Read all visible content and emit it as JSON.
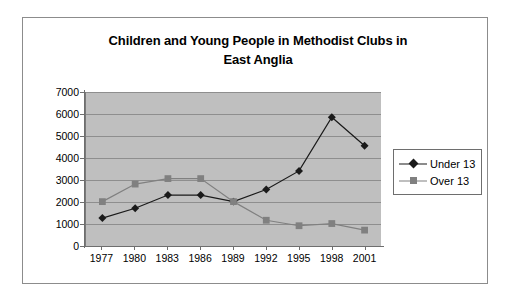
{
  "chart_data": {
    "type": "line",
    "title": "Children and Young People in Methodist Clubs in East Anglia",
    "title_line1": "Children and Young People in Methodist Clubs in",
    "title_line2": "East Anglia",
    "xlabel": "",
    "ylabel": "",
    "categories": [
      "1977",
      "1980",
      "1983",
      "1986",
      "1989",
      "1992",
      "1995",
      "1998",
      "2001"
    ],
    "ylim": [
      0,
      7000
    ],
    "ytick_step": 1000,
    "yticks": [
      "7000",
      "6000",
      "5000",
      "4000",
      "3000",
      "2000",
      "1000",
      "0"
    ],
    "grid": true,
    "legend_position": "right",
    "plot_background": "#bfbfbf",
    "series": [
      {
        "name": "Under 13",
        "color": "#1a1a1a",
        "marker": "diamond",
        "values": [
          1250,
          1700,
          2300,
          2300,
          2000,
          2550,
          3400,
          5850,
          4550
        ]
      },
      {
        "name": "Over 13",
        "color": "#808080",
        "marker": "square",
        "values": [
          2000,
          2800,
          3050,
          3050,
          2000,
          1150,
          900,
          1000,
          700
        ]
      }
    ]
  },
  "legend": {
    "items": [
      {
        "label": "Under 13"
      },
      {
        "label": "Over 13"
      }
    ]
  }
}
